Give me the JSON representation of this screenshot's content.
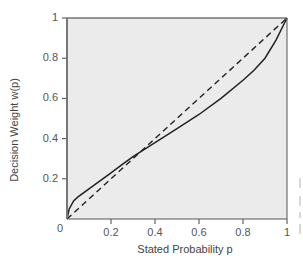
{
  "chart_data": {
    "type": "line",
    "title": "",
    "xlabel": "Stated Probability p",
    "ylabel": "Decision Weight w(p)",
    "xlim": [
      0,
      1
    ],
    "ylim": [
      0,
      1
    ],
    "grid": false,
    "legend": null,
    "background": "#ebebeb",
    "x_ticks": [
      "0.2",
      "0.4",
      "0.6",
      "0.8",
      "1"
    ],
    "y_ticks": [
      "0.2",
      "0.4",
      "0.6",
      "0.8",
      "1"
    ],
    "origin_label": "0",
    "series": [
      {
        "name": "Decision weight",
        "style": "solid",
        "color": "#222222",
        "x": [
          0,
          0.01,
          0.03,
          0.05,
          0.1,
          0.15,
          0.2,
          0.25,
          0.3,
          0.35,
          0.4,
          0.5,
          0.6,
          0.7,
          0.8,
          0.85,
          0.9,
          0.95,
          1.0
        ],
        "y": [
          0,
          0.05,
          0.09,
          0.11,
          0.15,
          0.19,
          0.23,
          0.27,
          0.31,
          0.345,
          0.38,
          0.45,
          0.52,
          0.6,
          0.69,
          0.74,
          0.8,
          0.89,
          1.0
        ]
      },
      {
        "name": "Identity (w = p)",
        "style": "dashed",
        "color": "#222222",
        "x": [
          0,
          1
        ],
        "y": [
          0,
          1
        ]
      }
    ]
  }
}
